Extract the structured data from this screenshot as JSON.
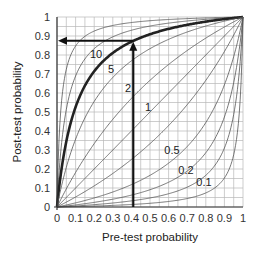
{
  "chart_data": {
    "type": "line",
    "title": "",
    "xlabel": "Pre-test probability",
    "ylabel": "Post-test probability",
    "xlim": [
      0,
      1
    ],
    "ylim": [
      0,
      1
    ],
    "grid": true,
    "grid_minor_step": 0.05,
    "x_ticks": [
      "0",
      "0.1",
      "0.2",
      "0.3",
      "0.4",
      "0.5",
      "0.6",
      "0.7",
      "0.8",
      "0.9",
      "1"
    ],
    "y_ticks": [
      "0",
      "0.1",
      "0.2",
      "0.3",
      "0.4",
      "0.5",
      "0.6",
      "0.7",
      "0.8",
      "0.9",
      "1"
    ],
    "legend": "none (curves labelled inline)",
    "series": [
      {
        "name": "LR 10",
        "likelihood_ratio": 10,
        "label": "10",
        "emphasis": true
      },
      {
        "name": "LR 5",
        "likelihood_ratio": 5,
        "label": "5"
      },
      {
        "name": "LR 2",
        "likelihood_ratio": 2,
        "label": "2"
      },
      {
        "name": "LR 1",
        "likelihood_ratio": 1,
        "label": "1"
      },
      {
        "name": "LR 0.5",
        "likelihood_ratio": 0.5,
        "label": "0.5"
      },
      {
        "name": "LR 0.2",
        "likelihood_ratio": 0.2,
        "label": "0.2"
      },
      {
        "name": "LR 0.1",
        "likelihood_ratio": 0.1,
        "label": "0.1"
      }
    ],
    "extra_unlabelled_curves": [
      50,
      20,
      0.05,
      0.02
    ],
    "annotation": {
      "pre_test_probability": 0.41,
      "post_test_probability": 0.875,
      "likelihood_ratio": 10,
      "description": "Vertical arrow up from pre-test 0.41 to LR 10 curve, then horizontal arrow left to post-test ~0.88"
    }
  },
  "colors": {
    "grid": "#b8b8b8",
    "curve": "#555555",
    "emphasis_curve": "#222222",
    "arrow": "#111111"
  }
}
